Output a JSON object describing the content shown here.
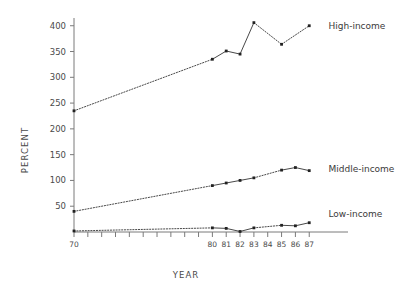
{
  "chart_data": {
    "type": "line",
    "title": "",
    "subtitle": "",
    "xlabel": "YEAR",
    "ylabel": "PERCENT",
    "xlim": [
      70,
      88.5
    ],
    "ylim": [
      0,
      415
    ],
    "grid": false,
    "legend_position": "inline-right-of-line-end",
    "y_ticks": [
      50,
      100,
      150,
      200,
      250,
      300,
      350,
      400
    ],
    "y_tick_labels": [
      "50",
      "100",
      "150",
      "200",
      "250",
      "300",
      "350",
      "400"
    ],
    "x_ticks": [
      70,
      71,
      72,
      73,
      74,
      75,
      76,
      77,
      78,
      79,
      80,
      81,
      82,
      83,
      84,
      85,
      86,
      87
    ],
    "x_tick_labels": [
      "70",
      "",
      "",
      "",
      "",
      "",
      "",
      "",
      "",
      "",
      "80",
      "81",
      "82",
      "83",
      "84",
      "85",
      "86",
      "87"
    ],
    "annotations": [
      {
        "text": "High-income",
        "x": 88.1,
        "y": 400
      },
      {
        "text": "Middle-income",
        "x": 88.1,
        "y": 122
      },
      {
        "text": "Low-income",
        "x": 88.1,
        "y": 35
      }
    ],
    "series": [
      {
        "name": "High-income",
        "label": "High-income",
        "line_style": "dotted-with-solid-segments",
        "marker": "square",
        "x": [
          70,
          80,
          81,
          82,
          83,
          85,
          87
        ],
        "values": [
          235,
          335,
          351,
          345,
          406,
          364,
          400
        ]
      },
      {
        "name": "Middle-income",
        "label": "Middle-income",
        "line_style": "dotted-with-solid-segments",
        "marker": "square",
        "x": [
          70,
          80,
          81,
          82,
          83,
          85,
          86,
          87
        ],
        "values": [
          40,
          90,
          95,
          100,
          105,
          120,
          125,
          119
        ]
      },
      {
        "name": "Low-income",
        "label": "Low-income",
        "line_style": "dotted-with-solid-segments",
        "marker": "square",
        "x": [
          70,
          80,
          81,
          82,
          83,
          85,
          86,
          87
        ],
        "values": [
          2,
          8,
          7,
          1,
          8,
          13,
          12,
          18
        ]
      }
    ],
    "colors": {
      "line": "#333333",
      "axis": "#7a7a7a",
      "text": "#4a4a4a",
      "background": "#ffffff"
    }
  }
}
